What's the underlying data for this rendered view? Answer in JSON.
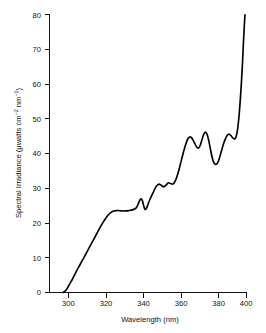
{
  "chart_data": {
    "type": "line",
    "title": "",
    "xlabel": "Wavelength (nm)",
    "ylabel_parts": {
      "main": "Spectral Irradiance (",
      "mu_watts": "μwatts cm",
      "exp1": "−2",
      "mid": " nm",
      "exp2": "−1",
      "close": ")"
    },
    "ylabel": "Spectral Irradiance (μwatts cm−2 nm−1)",
    "xlim": [
      295,
      400
    ],
    "ylim": [
      0,
      80
    ],
    "xticks": [
      300,
      320,
      340,
      360,
      380,
      400
    ],
    "yticks": [
      0,
      10,
      20,
      30,
      40,
      50,
      60,
      70,
      80
    ],
    "grid": false,
    "legend": false,
    "line_color": "#000000",
    "series": [
      {
        "name": "Solar spectral irradiance",
        "x": [
          297.0,
          298.0,
          299.0,
          300.0,
          301.0,
          302.0,
          303.5,
          305.0,
          306.5,
          308.0,
          310.0,
          312.0,
          314.0,
          316.0,
          318.0,
          319.5,
          321.0,
          322.5,
          324.0,
          325.5,
          327.0,
          328.5,
          330.0,
          332.0,
          334.0,
          336.0,
          338.0,
          339.0,
          340.0,
          340.8,
          341.5,
          342.2,
          343.0,
          343.8,
          344.8,
          346.0,
          347.5,
          349.0,
          350.2,
          351.2,
          352.2,
          353.2,
          354.2,
          355.2,
          356.2,
          357.5,
          359.0,
          360.5,
          362.0,
          363.5,
          365.0,
          366.2,
          367.2,
          368.2,
          369.2,
          370.2,
          371.2,
          372.0,
          373.0,
          374.0,
          375.0,
          376.0,
          377.0,
          378.0,
          379.0,
          380.0,
          381.0,
          382.0,
          383.0,
          384.0,
          385.0,
          386.0,
          387.0,
          388.0,
          389.0,
          390.0,
          391.0,
          392.0,
          393.0,
          394.0,
          395.0,
          396.0,
          397.0,
          397.8,
          398.4,
          398.9,
          399.3
        ],
        "y": [
          0.0,
          0.3,
          0.9,
          1.8,
          2.7,
          3.6,
          5.1,
          6.6,
          8.0,
          9.4,
          11.3,
          13.2,
          15.1,
          17.0,
          18.9,
          20.2,
          21.4,
          22.4,
          23.1,
          23.5,
          23.6,
          23.6,
          23.5,
          23.5,
          23.6,
          23.8,
          24.3,
          25.2,
          26.4,
          27.0,
          26.6,
          25.3,
          24.0,
          24.2,
          25.4,
          27.0,
          28.6,
          30.2,
          31.0,
          31.2,
          30.9,
          30.5,
          30.6,
          31.1,
          31.6,
          31.4,
          31.3,
          32.6,
          35.0,
          38.0,
          41.0,
          43.0,
          44.3,
          44.8,
          44.6,
          43.8,
          42.8,
          42.0,
          41.6,
          42.2,
          43.8,
          45.4,
          46.2,
          45.6,
          43.6,
          41.0,
          38.6,
          37.2,
          36.9,
          37.4,
          38.8,
          40.6,
          42.4,
          43.9,
          45.0,
          45.6,
          45.4,
          44.8,
          44.3,
          44.5,
          46.5,
          51.0,
          58.0,
          65.0,
          71.5,
          76.5,
          80.0
        ]
      }
    ]
  }
}
